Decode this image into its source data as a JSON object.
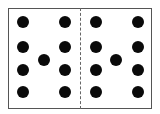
{
  "diagram": {
    "type": "dot-pattern",
    "frame": {
      "x": 8,
      "y": 8,
      "width": 144,
      "height": 101
    },
    "divider": {
      "style": "dashed",
      "x": 80
    },
    "panels": [
      {
        "name": "left",
        "dots": [
          {
            "x": 23,
            "y": 22
          },
          {
            "x": 65,
            "y": 22
          },
          {
            "x": 23,
            "y": 47
          },
          {
            "x": 65,
            "y": 47
          },
          {
            "x": 44,
            "y": 60
          },
          {
            "x": 23,
            "y": 70
          },
          {
            "x": 65,
            "y": 70
          },
          {
            "x": 23,
            "y": 92
          },
          {
            "x": 65,
            "y": 92
          }
        ]
      },
      {
        "name": "right",
        "dots": [
          {
            "x": 96,
            "y": 22
          },
          {
            "x": 138,
            "y": 22
          },
          {
            "x": 96,
            "y": 47
          },
          {
            "x": 138,
            "y": 47
          },
          {
            "x": 116,
            "y": 60
          },
          {
            "x": 96,
            "y": 70
          },
          {
            "x": 138,
            "y": 70
          },
          {
            "x": 96,
            "y": 92
          },
          {
            "x": 138,
            "y": 92
          }
        ]
      }
    ],
    "dot_color": "#0a0a0a",
    "dot_diameter": 12
  }
}
